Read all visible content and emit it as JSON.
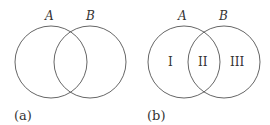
{
  "panels": [
    {
      "caption": "(a)",
      "set_labels": [
        "A",
        "B"
      ],
      "regions": []
    },
    {
      "caption": "(b)",
      "set_labels": [
        "A",
        "B"
      ],
      "regions": [
        "I",
        "II",
        "III"
      ]
    }
  ],
  "colors": {
    "stroke": "#555555",
    "text": "#333333",
    "background": "#ffffff"
  }
}
